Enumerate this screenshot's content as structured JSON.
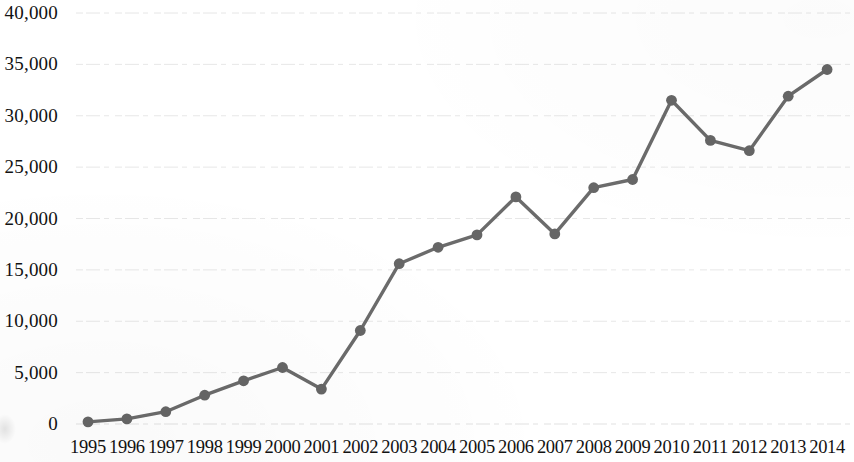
{
  "chart_data": {
    "type": "line",
    "title": "",
    "subtitle": "",
    "xlabel": "",
    "ylabel": "",
    "categories": [
      "1995",
      "1996",
      "1997",
      "1998",
      "1999",
      "2000",
      "2001",
      "2002",
      "2003",
      "2004",
      "2005",
      "2006",
      "2007",
      "2008",
      "2009",
      "2010",
      "2011",
      "2012",
      "2013",
      "2014"
    ],
    "values": [
      200,
      500,
      1200,
      2800,
      4200,
      5500,
      3400,
      9100,
      15600,
      17200,
      18400,
      22100,
      18500,
      23000,
      23800,
      31500,
      27600,
      26600,
      31900,
      34500
    ],
    "series": [
      {
        "name": "",
        "values": [
          200,
          500,
          1200,
          2800,
          4200,
          5500,
          3400,
          9100,
          15600,
          17200,
          18400,
          22100,
          18500,
          23000,
          23800,
          31500,
          27600,
          26600,
          31900,
          34500
        ]
      }
    ],
    "ylim": [
      0,
      40000
    ],
    "y_ticks": [
      0,
      5000,
      10000,
      15000,
      20000,
      25000,
      30000,
      35000,
      40000
    ],
    "y_tick_labels": [
      "0",
      "5,000",
      "10,000",
      "15,000",
      "20,000",
      "25,000",
      "30,000",
      "35,000",
      "40,000"
    ],
    "x_tick_labels": [
      "1995",
      "1996",
      "1997",
      "1998",
      "1999",
      "2000",
      "2001",
      "2002",
      "2003",
      "2004",
      "2005",
      "2006",
      "2007",
      "2008",
      "2009",
      "2010",
      "2011",
      "2012",
      "2013",
      "2014"
    ],
    "grid": "horizontal",
    "legend": "none",
    "annotations": [],
    "style": {
      "line_color": "#6b6b6b",
      "marker_color": "#666666",
      "marker_shape": "circle",
      "gridline_color": "#e2e2e2",
      "background_color": "#ffffff",
      "text_color": "#121212"
    }
  }
}
